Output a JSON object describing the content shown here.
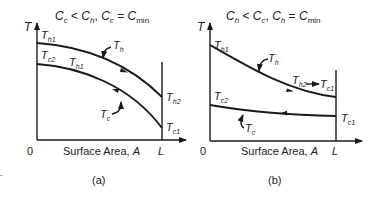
{
  "panels": [
    {
      "id": "a",
      "title": {
        "c1": "C",
        "s1": "c",
        "op1": " < ",
        "c2": "C",
        "s2": "h",
        "sep": ", ",
        "c3": "C",
        "s3": "c",
        "op2": " = ",
        "c4": "C",
        "s4": "min"
      },
      "y_axis_label": "T",
      "x_axis_label": "Surface Area, ",
      "x_axis_var": "A",
      "origin_label": "0",
      "end_label": "L",
      "caption": "(a)",
      "labels": {
        "th1_top": {
          "base": "T",
          "sub": "h1"
        },
        "tc2": {
          "base": "T",
          "sub": "c2"
        },
        "th1_mid": {
          "base": "T",
          "sub": "h1"
        },
        "th_curve": {
          "base": "T",
          "sub": "h"
        },
        "tc_curve": {
          "base": "T",
          "sub": "c"
        },
        "th2": {
          "base": "T",
          "sub": "h2"
        },
        "tc1": {
          "base": "T",
          "sub": "c1"
        }
      }
    },
    {
      "id": "b",
      "title": {
        "c1": "C",
        "s1": "h",
        "op1": " < ",
        "c2": "C",
        "s2": "c",
        "sep": ", ",
        "c3": "C",
        "s3": "h",
        "op2": " = ",
        "c4": "C",
        "s4": "min"
      },
      "y_axis_label": "T",
      "x_axis_label": "Surface Area, ",
      "x_axis_var": "A",
      "origin_label": "0",
      "end_label": "L",
      "caption": "(b)",
      "labels": {
        "th1": {
          "base": "T",
          "sub": "h1"
        },
        "th_curve": {
          "base": "T",
          "sub": "h"
        },
        "th2": {
          "base": "T",
          "sub": "h2"
        },
        "tc1_arrow_target": {
          "base": "T",
          "sub": "c1"
        },
        "tc2": {
          "base": "T",
          "sub": "c2"
        },
        "tc_curve": {
          "base": "T",
          "sub": "c"
        },
        "tc1": {
          "base": "T",
          "sub": "c1"
        }
      }
    }
  ]
}
